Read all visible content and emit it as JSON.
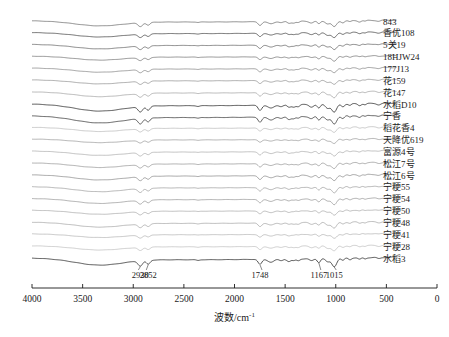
{
  "chart_data": {
    "type": "line",
    "title": "",
    "subtitle": "",
    "xlabel": "波数/cm-1",
    "xlabel_base": "波数/cm",
    "xlabel_sup": "-1",
    "ylabel": "",
    "xlim": [
      4000,
      0
    ],
    "xticks": [
      4000,
      3500,
      3000,
      2500,
      2000,
      1500,
      1000,
      500,
      0
    ],
    "xtick_labels": [
      "4000",
      "3500",
      "3000",
      "2500",
      "2000",
      "1500",
      "1000",
      "500",
      "0"
    ],
    "grid": false,
    "legend_position": "right-inline",
    "annotations": [
      {
        "label": "2930",
        "x": 2930
      },
      {
        "label": "2852",
        "x": 2852
      },
      {
        "label": "1748",
        "x": 1748
      },
      {
        "label": "1167",
        "x": 1167
      },
      {
        "label": "1015",
        "x": 1015
      }
    ],
    "series": [
      {
        "name": "843",
        "label": "843",
        "color": "#707070",
        "emphasis": false
      },
      {
        "name": "xiangyou108",
        "label": "香优108",
        "color": "#4a4a4a",
        "emphasis": false
      },
      {
        "name": "5guan19",
        "label": "5关19",
        "color": "#6a6a6a",
        "emphasis": false
      },
      {
        "name": "18HJW24",
        "label": "18HJW24",
        "color": "#7a7a7a",
        "emphasis": false
      },
      {
        "name": "177J13",
        "label": "177J13",
        "color": "#8a8a8a",
        "emphasis": false
      },
      {
        "name": "hua159",
        "label": "花159",
        "color": "#969696",
        "emphasis": false
      },
      {
        "name": "hua147",
        "label": "花147",
        "color": "#a6a6a6",
        "emphasis": false
      },
      {
        "name": "shuidaoD10",
        "label": "水稻D10",
        "color": "#2b2b2b",
        "emphasis": true
      },
      {
        "name": "ningxiang",
        "label": "宁香",
        "color": "#3a3a3a",
        "emphasis": true
      },
      {
        "name": "daohuaxiang4",
        "label": "稻花香4",
        "color": "#bdbdbd",
        "emphasis": false
      },
      {
        "name": "tianjiangyou619",
        "label": "天降优619",
        "color": "#9e9e9e",
        "emphasis": false
      },
      {
        "name": "fuyuan4hao",
        "label": "富源4号",
        "color": "#b0b0b0",
        "emphasis": false
      },
      {
        "name": "songjiang7hao",
        "label": "松江7号",
        "color": "#9a9a9a",
        "emphasis": false
      },
      {
        "name": "songjiang6hao",
        "label": "松江6号",
        "color": "#8e8e8e",
        "emphasis": false
      },
      {
        "name": "ningjing55",
        "label": "宁粳55",
        "color": "#a2a2a2",
        "emphasis": false
      },
      {
        "name": "ningjing54",
        "label": "宁粳54",
        "color": "#9a9a9a",
        "emphasis": false
      },
      {
        "name": "ningjing50",
        "label": "宁粳50",
        "color": "#adadad",
        "emphasis": false
      },
      {
        "name": "ningjing48",
        "label": "宁粳48",
        "color": "#a8a8a8",
        "emphasis": false
      },
      {
        "name": "ningjing41",
        "label": "宁粳41",
        "color": "#b8b8b8",
        "emphasis": false
      },
      {
        "name": "ningjing28",
        "label": "宁粳28",
        "color": "#c2c2c2",
        "emphasis": false
      },
      {
        "name": "shuidao3",
        "label": "水稻3",
        "color": "#2b2b2b",
        "emphasis": true
      }
    ]
  }
}
